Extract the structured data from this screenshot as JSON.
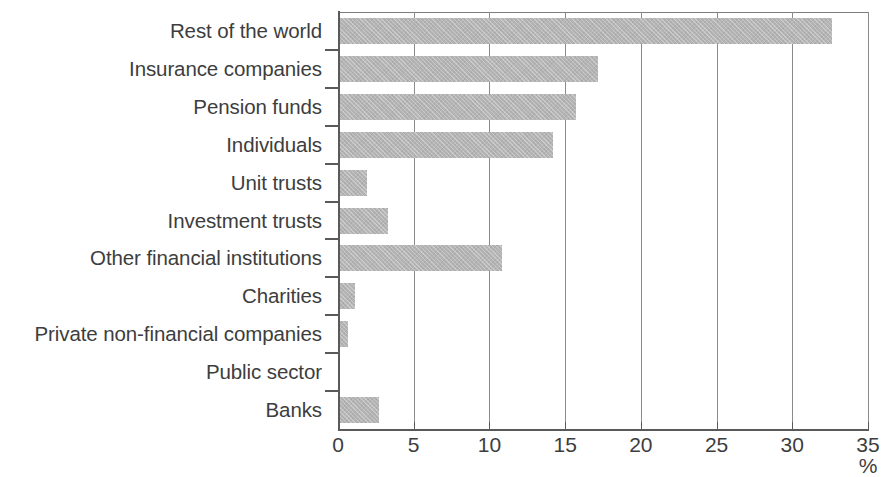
{
  "chart_data": {
    "type": "bar",
    "orientation": "horizontal",
    "title": "",
    "subtitle": "",
    "xlabel": "%",
    "ylabel": "",
    "xlim": [
      0,
      35
    ],
    "xticks": [
      "0",
      "5",
      "10",
      "15",
      "20",
      "25",
      "30",
      "35"
    ],
    "xtick_values": [
      0,
      5,
      10,
      15,
      20,
      25,
      30,
      35
    ],
    "grid": "vertical",
    "legend": "none",
    "bar_color": "#b4b4b4",
    "axis_color": "#5a5a5a",
    "categories": [
      "Rest of the world",
      "Insurance companies",
      "Pension funds",
      "Individuals",
      "Unit trusts",
      "Investment trusts",
      "Other financial institutions",
      "Charities",
      "Private non-financial companies",
      "Public sector",
      "Banks"
    ],
    "values": [
      32.6,
      17.2,
      15.7,
      14.2,
      1.9,
      3.3,
      10.8,
      1.1,
      0.65,
      0.1,
      2.7
    ]
  }
}
